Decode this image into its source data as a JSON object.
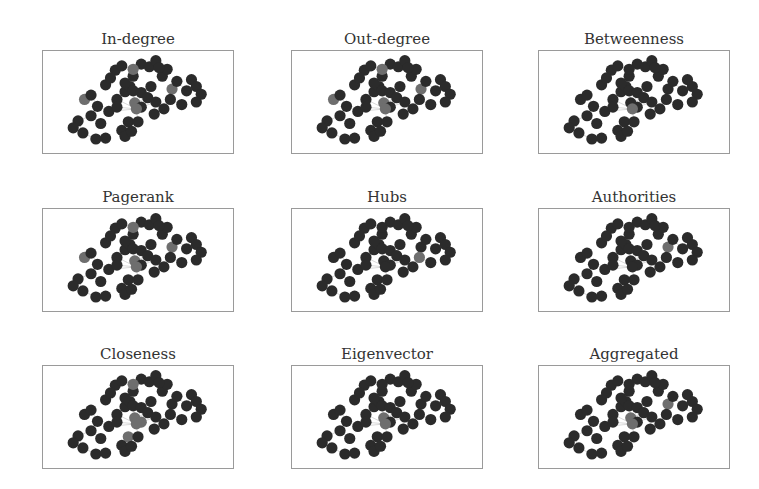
{
  "figure": {
    "panels": [
      {
        "title": "In-degree",
        "highlighted_nodes": [
          4,
          17,
          21,
          26,
          33
        ]
      },
      {
        "title": "Out-degree",
        "highlighted_nodes": [
          4,
          17,
          21,
          26,
          33
        ]
      },
      {
        "title": "Betweenness",
        "highlighted_nodes": [
          26
        ]
      },
      {
        "title": "Pagerank",
        "highlighted_nodes": [
          4,
          17,
          21,
          26,
          33
        ]
      },
      {
        "title": "Hubs",
        "highlighted_nodes": [
          34
        ]
      },
      {
        "title": "Authorities",
        "highlighted_nodes": [
          33
        ]
      },
      {
        "title": "Closeness",
        "highlighted_nodes": [
          17,
          21,
          26,
          25,
          22
        ]
      },
      {
        "title": "Eigenvector",
        "highlighted_nodes": [
          21,
          26
        ]
      },
      {
        "title": "Aggregated",
        "highlighted_nodes": [
          21,
          26,
          33
        ]
      }
    ],
    "colors": {
      "node": "#2b2b2b",
      "highlight": "#6e6e6e",
      "edge": "#c8c8c8",
      "frame": "#9a9a9a"
    }
  },
  "chart_data": {
    "type": "network",
    "panels": [
      "In-degree",
      "Out-degree",
      "Betweenness",
      "Pagerank",
      "Hubs",
      "Authorities",
      "Closeness",
      "Eigenvector",
      "Aggregated"
    ],
    "nodes": [
      [
        0.13,
        0.72
      ],
      [
        0.1,
        0.8
      ],
      [
        0.16,
        0.86
      ],
      [
        0.24,
        0.93
      ],
      [
        0.17,
        0.47
      ],
      [
        0.21,
        0.42
      ],
      [
        0.3,
        0.3
      ],
      [
        0.36,
        0.13
      ],
      [
        0.32,
        0.61
      ],
      [
        0.37,
        0.47
      ],
      [
        0.37,
        0.56
      ],
      [
        0.42,
        0.38
      ],
      [
        0.45,
        0.32
      ],
      [
        0.47,
        0.2
      ],
      [
        0.52,
        0.06
      ],
      [
        0.57,
        0.09
      ],
      [
        0.61,
        0.02
      ],
      [
        0.47,
        0.12
      ],
      [
        0.42,
        0.28
      ],
      [
        0.47,
        0.37
      ],
      [
        0.52,
        0.39
      ],
      [
        0.48,
        0.51
      ],
      [
        0.44,
        0.73
      ],
      [
        0.4,
        0.83
      ],
      [
        0.5,
        0.73
      ],
      [
        0.52,
        0.56
      ],
      [
        0.49,
        0.58
      ],
      [
        0.56,
        0.45
      ],
      [
        0.58,
        0.32
      ],
      [
        0.61,
        0.5
      ],
      [
        0.6,
        0.64
      ],
      [
        0.65,
        0.2
      ],
      [
        0.68,
        0.12
      ],
      [
        0.71,
        0.35
      ],
      [
        0.7,
        0.47
      ],
      [
        0.74,
        0.26
      ],
      [
        0.8,
        0.37
      ],
      [
        0.83,
        0.24
      ],
      [
        0.86,
        0.32
      ],
      [
        0.89,
        0.41
      ],
      [
        0.86,
        0.5
      ],
      [
        0.77,
        0.53
      ],
      [
        0.27,
        0.75
      ],
      [
        0.3,
        0.92
      ],
      [
        0.21,
        0.66
      ],
      [
        0.25,
        0.55
      ],
      [
        0.42,
        0.9
      ],
      [
        0.46,
        0.84
      ],
      [
        0.33,
        0.22
      ],
      [
        0.66,
        0.58
      ],
      [
        0.4,
        0.08
      ],
      [
        0.63,
        0.1
      ]
    ]
  }
}
